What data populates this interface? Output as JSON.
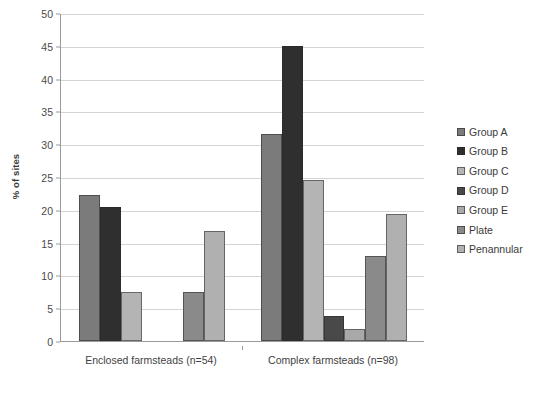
{
  "chart_data": {
    "type": "bar",
    "title": "",
    "xlabel": "",
    "ylabel": "% of sites",
    "ylim": [
      0,
      50
    ],
    "ytick_step": 5,
    "yticks": [
      0,
      5,
      10,
      15,
      20,
      25,
      30,
      35,
      40,
      45,
      50
    ],
    "grid": true,
    "legend_position": "right",
    "categories": [
      "Enclosed farmsteads (n=54)",
      "Complex farmsteads (n=98)"
    ],
    "series": [
      {
        "name": "Group A",
        "color": "#7b7b7b",
        "values": [
          22.2,
          31.6
        ]
      },
      {
        "name": "Group B",
        "color": "#2f2f2f",
        "values": [
          20.4,
          44.9
        ]
      },
      {
        "name": "Group C",
        "color": "#b4b4b4",
        "values": [
          7.4,
          24.5
        ]
      },
      {
        "name": "Group D",
        "color": "#494949",
        "values": [
          0,
          3.8
        ]
      },
      {
        "name": "Group E",
        "color": "#a9a9a9",
        "values": [
          0,
          1.8
        ]
      },
      {
        "name": "Plate",
        "color": "#8a8a8a",
        "values": [
          7.4,
          13.0
        ]
      },
      {
        "name": "Penannular",
        "color": "#b0b0b0",
        "values": [
          16.7,
          19.4
        ]
      }
    ]
  },
  "axis": {
    "y_title": "% of sites",
    "y_tick_labels": [
      "0",
      "5",
      "10",
      "15",
      "20",
      "25",
      "30",
      "35",
      "40",
      "45",
      "50"
    ]
  },
  "legend": {
    "items": [
      {
        "label": "Group A"
      },
      {
        "label": "Group B"
      },
      {
        "label": "Group C"
      },
      {
        "label": "Group D"
      },
      {
        "label": "Group E"
      },
      {
        "label": "Plate"
      },
      {
        "label": "Penannular"
      }
    ]
  },
  "footer": {
    "remnant_text": ""
  }
}
